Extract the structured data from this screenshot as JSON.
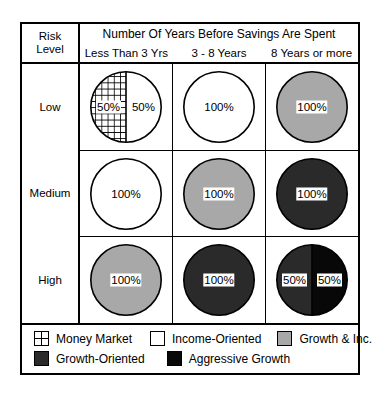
{
  "chart_data": {
    "type": "table",
    "title": "Number Of Years Before Savings Are Spent",
    "row_header": {
      "line1": "Risk",
      "line2": "Level"
    },
    "columns": [
      "Less Than 3 Yrs",
      "3 - 8 Years",
      "8 Years or more"
    ],
    "rows": [
      "Low",
      "Medium",
      "High"
    ],
    "legend_keys": [
      {
        "key": "money-market",
        "label": "Money Market",
        "fill": "grid",
        "color": "#ffffff"
      },
      {
        "key": "income-oriented",
        "label": "Income-Oriented",
        "fill": "solid",
        "color": "#ffffff"
      },
      {
        "key": "growth-and-inc",
        "label": "Growth & Inc.",
        "fill": "solid",
        "color": "#a8a8a8"
      },
      {
        "key": "growth-oriented",
        "label": "Growth-Oriented",
        "fill": "solid",
        "color": "#2a2a2a"
      },
      {
        "key": "aggressive-growth",
        "label": "Aggressive Growth",
        "fill": "solid",
        "color": "#080808"
      }
    ],
    "cells": [
      {
        "row": "Low",
        "column": "Less Than 3 Yrs",
        "slices": [
          {
            "key": "money-market",
            "value": 50,
            "label": "50%",
            "position": "left"
          },
          {
            "key": "income-oriented",
            "value": 50,
            "label": "50%",
            "position": "right"
          }
        ]
      },
      {
        "row": "Low",
        "column": "3 - 8 Years",
        "slices": [
          {
            "key": "income-oriented",
            "value": 100,
            "label": "100%",
            "position": "center"
          }
        ]
      },
      {
        "row": "Low",
        "column": "8 Years or more",
        "slices": [
          {
            "key": "growth-and-inc",
            "value": 100,
            "label": "100%",
            "position": "center"
          }
        ]
      },
      {
        "row": "Medium",
        "column": "Less Than 3 Yrs",
        "slices": [
          {
            "key": "income-oriented",
            "value": 100,
            "label": "100%",
            "position": "center"
          }
        ]
      },
      {
        "row": "Medium",
        "column": "3 - 8 Years",
        "slices": [
          {
            "key": "growth-and-inc",
            "value": 100,
            "label": "100%",
            "position": "center"
          }
        ]
      },
      {
        "row": "Medium",
        "column": "8 Years or more",
        "slices": [
          {
            "key": "growth-oriented",
            "value": 100,
            "label": "100%",
            "position": "center"
          }
        ]
      },
      {
        "row": "High",
        "column": "Less Than 3 Yrs",
        "slices": [
          {
            "key": "growth-and-inc",
            "value": 100,
            "label": "100%",
            "position": "center"
          }
        ]
      },
      {
        "row": "High",
        "column": "3 - 8 Years",
        "slices": [
          {
            "key": "growth-oriented",
            "value": 100,
            "label": "100%",
            "position": "center"
          }
        ]
      },
      {
        "row": "High",
        "column": "8 Years or more",
        "slices": [
          {
            "key": "growth-oriented",
            "value": 50,
            "label": "50%",
            "position": "left"
          },
          {
            "key": "aggressive-growth",
            "value": 50,
            "label": "50%",
            "position": "right"
          }
        ]
      }
    ]
  }
}
